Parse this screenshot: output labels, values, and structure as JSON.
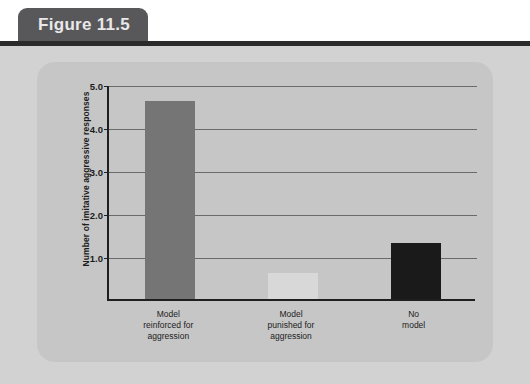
{
  "figure": {
    "tab_label": "Figure 11.5"
  },
  "colors": {
    "tab_background": "#58585a",
    "tab_text": "#e9e9e9",
    "header_rule": "#2b2b2b",
    "outer_background": "#d2d2d2",
    "panel_background": "#c6c6c6",
    "axis_line": "#1f1f1f",
    "gridline": "#6a6a6a",
    "bar_gray": "#757575",
    "bar_white": "#d8d8d8",
    "bar_black": "#1a1a1a"
  },
  "chart_data": {
    "type": "bar",
    "title": "",
    "xlabel": "",
    "ylabel": "Number of imitative aggressive responses",
    "categories": [
      "Model\nreinforced for\naggression",
      "Model\npunished for\naggression",
      "No\nmodel"
    ],
    "values": [
      4.6,
      0.6,
      1.3
    ],
    "bar_colors": [
      "#757575",
      "#d8d8d8",
      "#1a1a1a"
    ],
    "ylim": [
      0,
      5.0
    ],
    "yticks": [
      1.0,
      2.0,
      3.0,
      4.0,
      5.0
    ],
    "ytick_labels": [
      "1.0",
      "2.0",
      "3.0",
      "4.0",
      "5.0"
    ],
    "grid": true,
    "legend": false,
    "legend_position": "none"
  }
}
